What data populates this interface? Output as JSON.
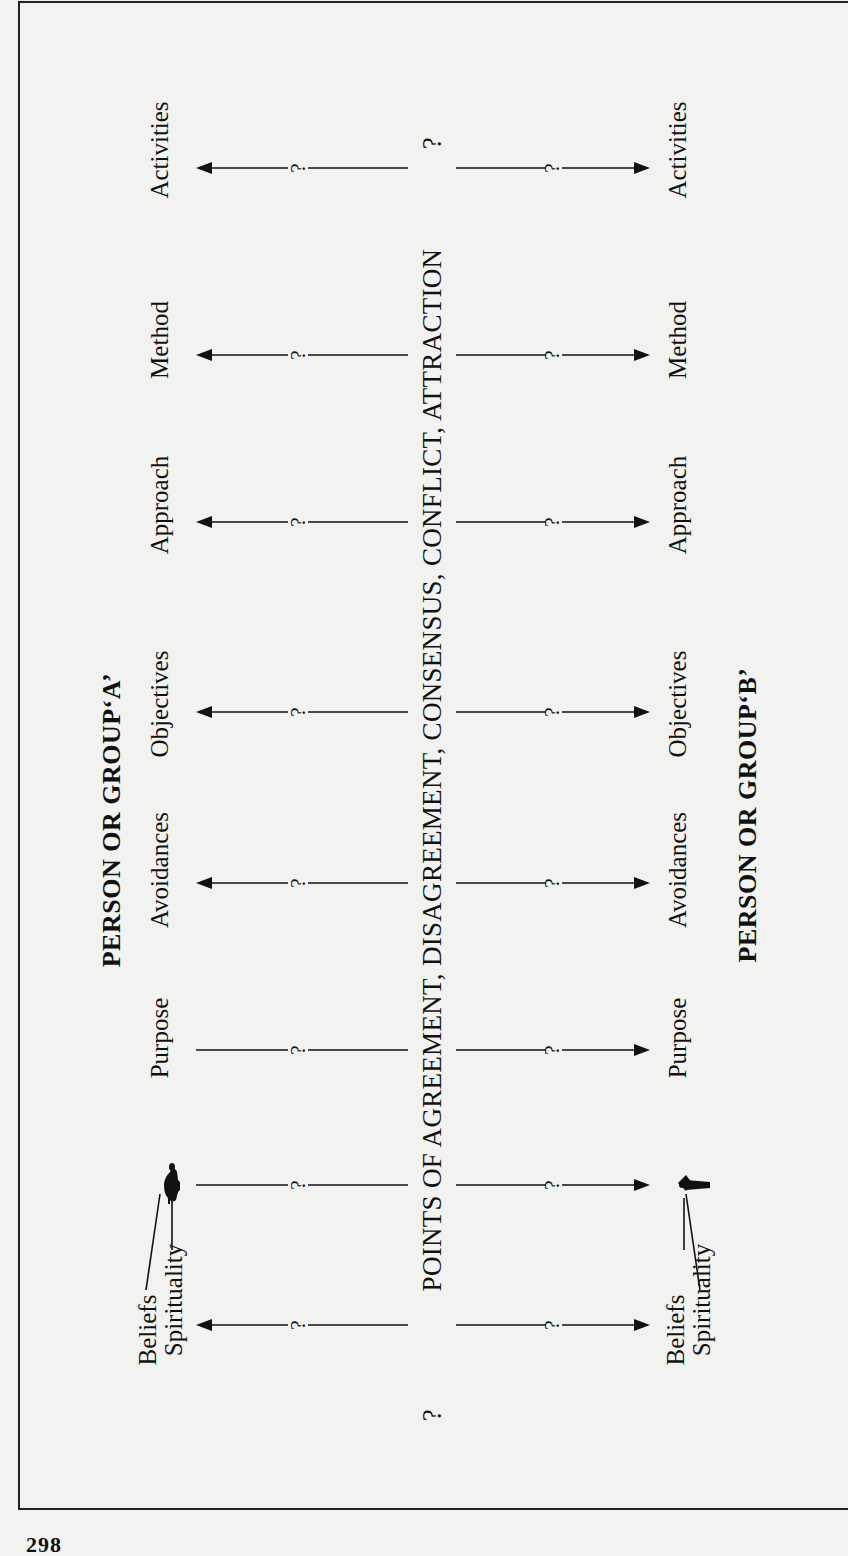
{
  "diagram": {
    "center_title": "POINTS OF AGREEMENT, DISAGREEMENT, CONSENSUS, CONFLICT, ATTRACTION",
    "center_title_prefix": "?",
    "center_title_suffix": "?",
    "group_a": {
      "heading": "PERSON OR GROUP‘A’",
      "labels": {
        "activities": "Activities",
        "method": "Method",
        "approach": "Approach",
        "objectives": "Objectives",
        "avoidances": "Avoidances",
        "purpose": "Purpose",
        "beliefs": "Beliefs",
        "spirituality": "Spirituality"
      },
      "figure_icon": "person-silhouette-icon"
    },
    "group_b": {
      "heading": "PERSON OR GROUP‘B’",
      "labels": {
        "activities": "Activities",
        "method": "Method",
        "approach": "Approach",
        "objectives": "Objectives",
        "avoidances": "Avoidances",
        "purpose": "Purpose",
        "beliefs": "Beliefs",
        "spirituality": "Spirituality"
      },
      "figure_icon": "person-silhouette-icon"
    },
    "connector_mark": "?",
    "rows": [
      {
        "name": "activities",
        "y": 168,
        "left_arrow": true,
        "right_arrow": true
      },
      {
        "name": "method",
        "y": 355,
        "left_arrow": true,
        "right_arrow": true
      },
      {
        "name": "approach",
        "y": 522,
        "left_arrow": true,
        "right_arrow": true
      },
      {
        "name": "objectives",
        "y": 712,
        "left_arrow": true,
        "right_arrow": true
      },
      {
        "name": "avoidances",
        "y": 883,
        "left_arrow": true,
        "right_arrow": true
      },
      {
        "name": "purpose",
        "y": 1050,
        "left_arrow": false,
        "right_arrow": true
      },
      {
        "name": "figure",
        "y": 1185,
        "left_arrow": false,
        "right_arrow": true
      },
      {
        "name": "beliefs",
        "y": 1325,
        "left_arrow": true,
        "right_arrow": true
      }
    ]
  },
  "page": {
    "number": "298"
  }
}
